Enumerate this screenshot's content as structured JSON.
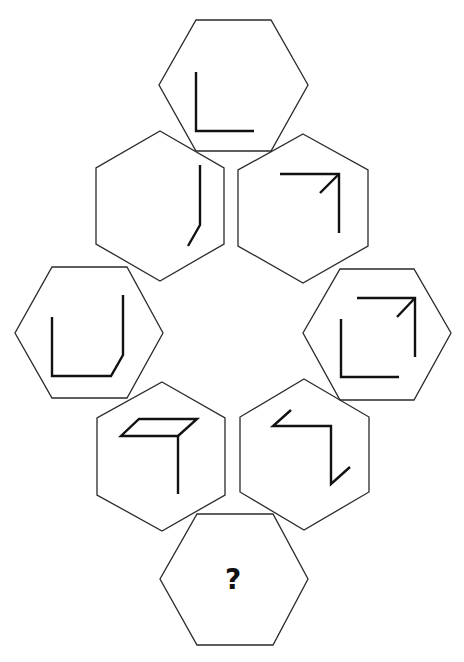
{
  "puzzle": {
    "type": "hexagon-sequence-reasoning",
    "question_mark": "?",
    "colors": {
      "background": "#ffffff",
      "outline": "#2a2a2a",
      "stroke": "#111111"
    },
    "hexagons": [
      {
        "id": "top",
        "orientation": "flat-top",
        "figure": "L-shape (vertical line + bottom horizontal line)"
      },
      {
        "id": "upper-left",
        "orientation": "pointy-top",
        "figure": "vertical line with short diagonal tail at bottom-left"
      },
      {
        "id": "upper-right",
        "orientation": "pointy-top",
        "figure": "horizontal top line + right vertical line + diagonal arrow into corner"
      },
      {
        "id": "middle-left",
        "orientation": "flat-top",
        "figure": "U-shape with beveled bottom-right corner"
      },
      {
        "id": "middle-right",
        "orientation": "flat-top",
        "figure": "L-shape plus top-right corner bracket with diagonal arrow"
      },
      {
        "id": "lower-left",
        "orientation": "pointy-top",
        "figure": "parallelogram top with vertical line descending"
      },
      {
        "id": "lower-right",
        "orientation": "pointy-top",
        "figure": "Z-shape with diagonal ends"
      },
      {
        "id": "bottom",
        "orientation": "flat-top",
        "figure": "question mark",
        "label": "?"
      }
    ]
  }
}
